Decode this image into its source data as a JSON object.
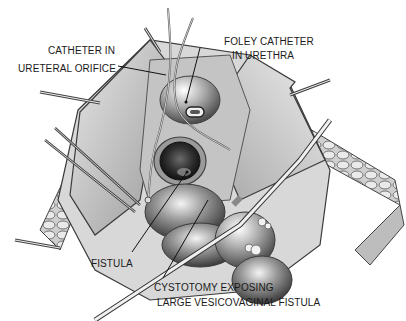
{
  "figure": {
    "type": "surgical illustration",
    "labels": {
      "catheter_ureteral_line1": "CATHETER IN",
      "catheter_ureteral_line2": "URETERAL ORIFICE",
      "foley_line1": "FOLEY CATHETER",
      "foley_line2": "IN URETHRA",
      "fistula": "FISTULA",
      "cystotomy_line1": "CYSTOTOMY EXPOSING",
      "cystotomy_line2": "LARGE VESICOVAGINAL FISTULA"
    }
  }
}
